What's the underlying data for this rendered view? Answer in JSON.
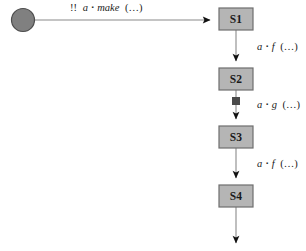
{
  "diagram": {
    "type": "state-transition-diagram",
    "background_color": "#ffffff",
    "palette": {
      "state_fill": "#b5b5b5",
      "state_stroke": "#6e6e6e",
      "start_node_fill": "#808080",
      "start_node_stroke": "#4d4d4d",
      "marker_fill": "#4a4a4a",
      "edge_color": "#8a8a8a",
      "arrow_color": "#111111",
      "text_color": "#1a1a1a"
    },
    "start_node": {
      "name": "initial-state",
      "shape": "filled-circle",
      "cx": 23,
      "cy": 20,
      "r": 11.5
    },
    "states": [
      {
        "id": "S1",
        "label": "S1",
        "x": 219,
        "y": 8,
        "w": 34,
        "h": 22
      },
      {
        "id": "S2",
        "label": "S2",
        "x": 219,
        "y": 68,
        "w": 34,
        "h": 22
      },
      {
        "id": "S3",
        "label": "S3",
        "x": 219,
        "y": 126,
        "w": 34,
        "h": 22
      },
      {
        "id": "S4",
        "label": "S4",
        "x": 219,
        "y": 185,
        "w": 34,
        "h": 22
      }
    ],
    "transitions": [
      {
        "id": "t-start-s1",
        "from": "initial-state",
        "to": "S1",
        "orientation": "horizontal",
        "label_parts": {
          "prefix": "!!",
          "receiver": "a",
          "separator": "▪",
          "message": "make",
          "args": "(…)"
        },
        "label_text": "!! a▪make (…)",
        "label_x": 70,
        "label_y": 8,
        "has_marker": false
      },
      {
        "id": "t-s1-s2",
        "from": "S1",
        "to": "S2",
        "orientation": "vertical",
        "label_parts": {
          "prefix": "",
          "receiver": "a",
          "separator": "▪",
          "message": "f",
          "args": "(…)"
        },
        "label_text": "a▪f (…)",
        "label_x": 257,
        "label_y": 48,
        "has_marker": false
      },
      {
        "id": "t-s2-s3",
        "from": "S2",
        "to": "S3",
        "orientation": "vertical",
        "label_parts": {
          "prefix": "",
          "receiver": "a",
          "separator": "▪",
          "message": "g",
          "args": "(…)"
        },
        "label_text": "a▪g (…)",
        "label_x": 257,
        "label_y": 106,
        "has_marker": true,
        "marker": {
          "name": "transition-stop-marker",
          "x": 232,
          "y": 101,
          "size": 8
        }
      },
      {
        "id": "t-s3-s4",
        "from": "S3",
        "to": "S4",
        "orientation": "vertical",
        "label_parts": {
          "prefix": "",
          "receiver": "a",
          "separator": "▪",
          "message": "f",
          "args": "(…)"
        },
        "label_text": "a▪f (…)",
        "label_x": 257,
        "label_y": 165,
        "has_marker": false
      },
      {
        "id": "t-s4-out",
        "from": "S4",
        "to": null,
        "orientation": "vertical",
        "label_parts": {
          "prefix": "",
          "receiver": "",
          "separator": "",
          "message": "",
          "args": ""
        },
        "label_text": "",
        "label_x": 0,
        "label_y": 0,
        "has_marker": false
      }
    ]
  }
}
